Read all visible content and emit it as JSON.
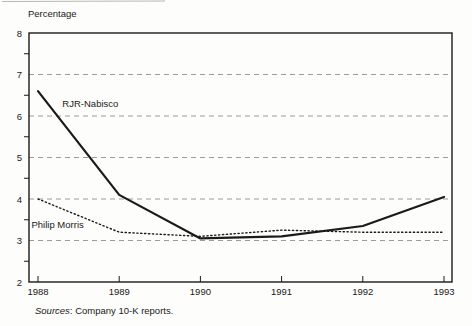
{
  "figure": {
    "background": "#fdfdfb"
  },
  "chart_data": {
    "type": "line",
    "title": "",
    "y_axis_label": "Percentage",
    "xlabel": "",
    "ylabel": "Percentage",
    "x_tick_labels": [
      "1988",
      "1989",
      "1990",
      "1991",
      "1992",
      "1993"
    ],
    "ylim": [
      2,
      8
    ],
    "y_major_ticks": [
      2,
      3,
      4,
      5,
      6,
      7,
      8
    ],
    "y_minor_ticks": [
      2.5,
      3.5,
      4.5,
      5.5,
      6.5,
      7.5
    ],
    "gridline_y_values": [
      3,
      4,
      5,
      6,
      7
    ],
    "grid_style": "dashed",
    "grid_on": true,
    "legend_position": "inline-labels-on-chart",
    "colors": {
      "line": "#1a1a1a",
      "grid": "#9b9b9b",
      "text": "#1a1a1a",
      "frame": "#1a1a1a"
    },
    "series": [
      {
        "name": "RJR-Nabisco",
        "line_style": "solid",
        "values": [
          6.6,
          4.1,
          3.05,
          3.1,
          3.35,
          4.05
        ],
        "label_anchor": {
          "x": 1988.3,
          "y": 6.22
        }
      },
      {
        "name": "Philip Morris",
        "line_style": "dotted",
        "values": [
          4.0,
          3.2,
          3.1,
          3.25,
          3.2,
          3.2
        ],
        "label_anchor": {
          "x": 1987.92,
          "y": 3.3
        }
      }
    ],
    "source_note": {
      "italic_part": "Sources",
      "rest_part": ": Company 10-K reports."
    }
  }
}
